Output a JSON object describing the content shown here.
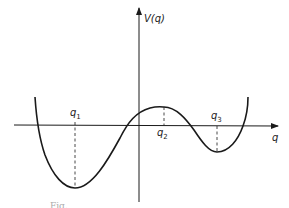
{
  "diagram": {
    "type": "potential-energy-curve",
    "axes": {
      "x_label": "q",
      "y_label": "V(q)"
    },
    "markers": [
      {
        "id": "q1",
        "label": "q",
        "sub": "1",
        "kind": "global minimum"
      },
      {
        "id": "q2",
        "label": "q",
        "sub": "2",
        "kind": "local maximum"
      },
      {
        "id": "q3",
        "label": "q",
        "sub": "3",
        "kind": "local minimum"
      }
    ],
    "caption": "Fig."
  },
  "colors": {
    "ink": "#1a1a1a",
    "background": "#ffffff"
  }
}
